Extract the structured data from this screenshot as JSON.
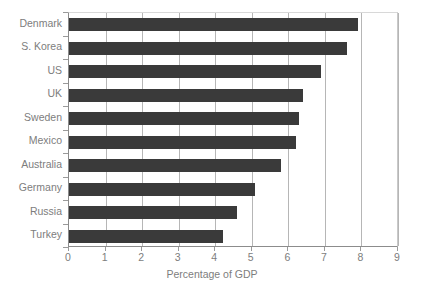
{
  "chart_data": {
    "type": "bar",
    "orientation": "horizontal",
    "title": "",
    "xlabel": "Percentage of GDP",
    "ylabel": "",
    "xlim": [
      0,
      9
    ],
    "ylim": null,
    "grid": "vertical",
    "legend": null,
    "categories": [
      "Denmark",
      "S. Korea",
      "US",
      "UK",
      "Sweden",
      "Mexico",
      "Australia",
      "Germany",
      "Russia",
      "Turkey"
    ],
    "values": [
      7.9,
      7.6,
      6.9,
      6.4,
      6.3,
      6.2,
      5.8,
      5.1,
      4.6,
      4.2
    ],
    "xticks": [
      "0",
      "1",
      "2",
      "3",
      "4",
      "5",
      "6",
      "7",
      "8",
      "9"
    ],
    "bar_color": "#3a3a3a",
    "grid_color": "#b6b6b6",
    "axis_color": "#8c8c8c",
    "text_color": "#7d7d7d"
  }
}
